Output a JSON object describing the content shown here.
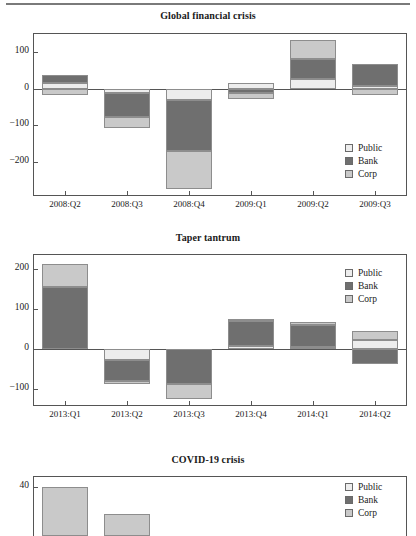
{
  "figure": {
    "title_rule": "divider",
    "panel_count": 3
  },
  "legend": {
    "entries": [
      {
        "label": "Public",
        "color": "#ededed"
      },
      {
        "label": "Bank",
        "color": "#6f6f6f"
      },
      {
        "label": "Corp",
        "color": "#c9c9c9"
      }
    ]
  },
  "chart_data": [
    {
      "type": "bar",
      "stacked": true,
      "title": "Global financial crisis",
      "xlabel": "",
      "ylabel": "",
      "categories": [
        "2008:Q2",
        "2008:Q3",
        "2008:Q4",
        "2009:Q1",
        "2009:Q2",
        "2009:Q3"
      ],
      "yticks": [
        100,
        0,
        -100,
        -200
      ],
      "ylim": [
        -290,
        150
      ],
      "grid": false,
      "legend_position": "bottom-right",
      "series": [
        {
          "name": "Public",
          "values": [
            15,
            -12,
            -30,
            15,
            28,
            8
          ]
        },
        {
          "name": "Bank",
          "values": [
            22,
            -65,
            -140,
            -10,
            55,
            60
          ]
        },
        {
          "name": "Corp",
          "values": [
            -18,
            -30,
            -105,
            -18,
            50,
            -18
          ]
        }
      ]
    },
    {
      "type": "bar",
      "stacked": true,
      "title": "Taper tantrum",
      "xlabel": "",
      "ylabel": "",
      "categories": [
        "2013:Q1",
        "2013:Q2",
        "2013:Q3",
        "2013:Q4",
        "2014:Q1",
        "2014:Q2"
      ],
      "yticks": [
        200,
        100,
        0,
        -100
      ],
      "ylim": [
        -140,
        235
      ],
      "grid": false,
      "legend_position": "top-right",
      "series": [
        {
          "name": "Public",
          "values": [
            0,
            -28,
            0,
            8,
            5,
            22
          ]
        },
        {
          "name": "Bank",
          "values": [
            155,
            -52,
            -88,
            62,
            55,
            -38
          ]
        },
        {
          "name": "Corp",
          "values": [
            58,
            -8,
            -36,
            6,
            8,
            22
          ]
        }
      ]
    },
    {
      "type": "bar",
      "stacked": true,
      "title": "COVID-19 crisis",
      "xlabel": "",
      "ylabel": "",
      "categories": [],
      "yticks": [
        40
      ],
      "ylim": [
        0,
        48
      ],
      "grid": false,
      "legend_position": "top-right",
      "clipped": true,
      "series": [
        {
          "name": "Corp",
          "values": [
            40,
            18
          ]
        }
      ]
    }
  ]
}
